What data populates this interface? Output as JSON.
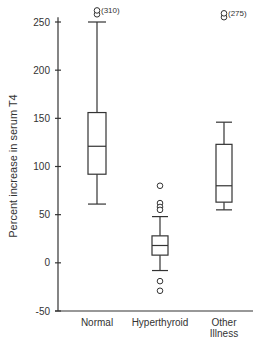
{
  "chart_data": {
    "type": "boxplot",
    "title": "",
    "xlabel": "",
    "ylabel": "Percent increase in serum T4",
    "ylim": [
      -50,
      260
    ],
    "yticks": [
      -50,
      0,
      50,
      100,
      150,
      200,
      250
    ],
    "grid": false,
    "legend": null,
    "categories": [
      "Normal",
      "Hyperthyroid",
      "Other Illness"
    ],
    "category_label_lines": [
      [
        "Normal"
      ],
      [
        "Hyperthyroid"
      ],
      [
        "Other",
        "Illness"
      ]
    ],
    "series": [
      {
        "name": "Normal",
        "whisker_low": 61,
        "q1": 92,
        "median": 121,
        "q3": 156,
        "whisker_high": 250,
        "outliers": [
          258,
          262
        ],
        "outlier_annotation": "(310)"
      },
      {
        "name": "Hyperthyroid",
        "whisker_low": -8,
        "q1": 8,
        "median": 18,
        "q3": 28,
        "whisker_high": 48,
        "outliers": [
          80,
          62,
          58,
          55,
          -19,
          -29
        ],
        "outlier_annotation": ""
      },
      {
        "name": "Other Illness",
        "whisker_low": 55,
        "q1": 63,
        "median": 80,
        "q3": 123,
        "whisker_high": 146,
        "outliers": [
          255,
          259
        ],
        "outlier_annotation": "(275)"
      }
    ]
  },
  "layout": {
    "axis_x": 58,
    "axis_right": 253,
    "y_at_minus50": 311,
    "y_at_250": 22,
    "box_centers": [
      97,
      160,
      224
    ],
    "box_half_widths": [
      9,
      8,
      8
    ],
    "cap_half_widths": [
      9,
      8,
      8
    ]
  },
  "caption_fragment": "FIG. ..."
}
